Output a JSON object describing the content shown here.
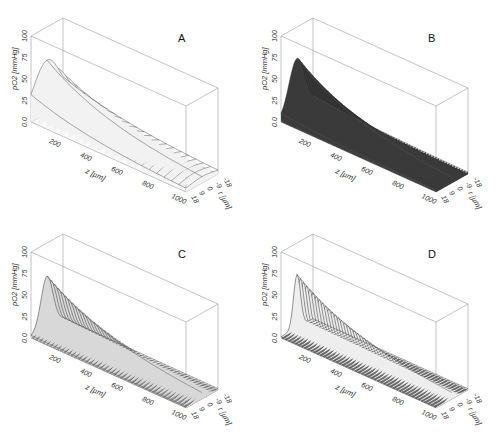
{
  "figure": {
    "panels": [
      "A",
      "B",
      "C",
      "D"
    ]
  },
  "chart_data": [
    {
      "type": "surface3d",
      "panel": "A",
      "title": "A",
      "xlabel": "z [µm]",
      "ylabel": "pO2 [mmHg]",
      "rlabel": "r [µm]",
      "xticks": [
        "200",
        "400",
        "600",
        "800",
        "1000"
      ],
      "zticks": [
        "0.0",
        "25",
        "50",
        "75",
        "100"
      ],
      "rticks": [
        "-18",
        "-9",
        "0",
        "9",
        "18"
      ],
      "xlim": [
        0,
        1000
      ],
      "zlim": [
        0,
        100
      ],
      "rlim": [
        -18,
        18
      ],
      "peak_pO2_at_z0": 60,
      "pO2_at_z1000": 6,
      "radial_profile": "broad",
      "shading": "light",
      "n_lines": 22
    },
    {
      "type": "surface3d",
      "panel": "B",
      "title": "B",
      "xlabel": "z [µm]",
      "ylabel": "pO2 [mmHg]",
      "rlabel": "r [µm]",
      "xticks": [
        "200",
        "400",
        "600",
        "800",
        "1000"
      ],
      "zticks": [
        "0.0",
        "25",
        "50",
        "75",
        "100"
      ],
      "rticks": [
        "-18",
        "-9",
        "0",
        "9",
        "18"
      ],
      "xlim": [
        0,
        1000
      ],
      "zlim": [
        0,
        100
      ],
      "rlim": [
        -18,
        18
      ],
      "peak_pO2_at_z0": 62,
      "pO2_at_z1000": 5,
      "radial_profile": "medium",
      "shading": "dark",
      "n_lines": 60
    },
    {
      "type": "surface3d",
      "panel": "C",
      "title": "C",
      "xlabel": "z [µm]",
      "ylabel": "pO2 [mmHg]",
      "rlabel": "r [µm]",
      "xticks": [
        "200",
        "400",
        "600",
        "800",
        "1000"
      ],
      "zticks": [
        "0.0",
        "25",
        "50",
        "75",
        "100"
      ],
      "rticks": [
        "-18",
        "-9",
        "0",
        "9",
        "18"
      ],
      "xlim": [
        0,
        1000
      ],
      "zlim": [
        0,
        100
      ],
      "rlim": [
        -18,
        18
      ],
      "peak_pO2_at_z0": 60,
      "pO2_at_z1000": 6,
      "radial_profile": "medium-narrow",
      "shading": "mixed",
      "n_lines": 45
    },
    {
      "type": "surface3d",
      "panel": "D",
      "title": "D",
      "xlabel": "z [µm]",
      "ylabel": "pO2 [mmHg]",
      "rlabel": "r [µm]",
      "xticks": [
        "200",
        "400",
        "600",
        "800",
        "1000"
      ],
      "zticks": [
        "0.0",
        "25",
        "50",
        "75",
        "100"
      ],
      "rticks": [
        "-18",
        "-9",
        "0",
        "9",
        "18"
      ],
      "xlim": [
        0,
        1000
      ],
      "zlim": [
        0,
        100
      ],
      "rlim": [
        -18,
        18
      ],
      "peak_pO2_at_z0": 62,
      "pO2_at_z1000": 6,
      "radial_profile": "narrow",
      "shading": "dark-base",
      "n_lines": 50
    }
  ]
}
